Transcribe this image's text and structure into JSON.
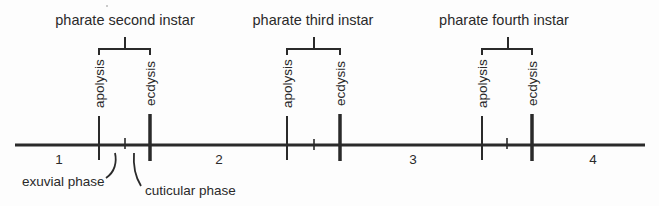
{
  "diagram": {
    "colors": {
      "line": "#2a2a2a",
      "background": "#fdfdfd"
    },
    "timeline": {
      "y": 145,
      "x_start": 15,
      "x_end": 645
    },
    "instars": [
      {
        "title": "pharate second instar",
        "apolysis_label": "apolysis",
        "ecdysis_label": "ecdysis",
        "apolysis_x": 99,
        "mid_x": 125,
        "ecdysis_x": 150
      },
      {
        "title": "pharate third instar",
        "apolysis_label": "apolysis",
        "ecdysis_label": "ecdysis",
        "apolysis_x": 287,
        "mid_x": 314,
        "ecdysis_x": 340
      },
      {
        "title": "pharate fourth instar",
        "apolysis_label": "apolysis",
        "ecdysis_label": "ecdysis",
        "apolysis_x": 482,
        "mid_x": 507,
        "ecdysis_x": 532
      }
    ],
    "stage_numbers": [
      {
        "label": "1",
        "x": 59
      },
      {
        "label": "2",
        "x": 219
      },
      {
        "label": "3",
        "x": 413
      },
      {
        "label": "4",
        "x": 593
      }
    ],
    "phase_labels": {
      "exuvial": "exuvial phase",
      "cuticular": "cuticular phase"
    }
  }
}
